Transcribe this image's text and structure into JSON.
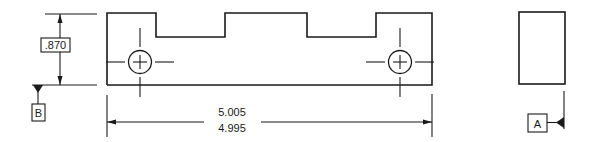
{
  "drawing": {
    "front_view": {
      "height_dimension": {
        "value": ".870"
      },
      "length_dimension": {
        "upper_limit": "5.005",
        "lower_limit": "4.995"
      },
      "holes": [
        {
          "name": "left-hole"
        },
        {
          "name": "right-hole"
        }
      ]
    },
    "datums": {
      "b": {
        "label": "B"
      },
      "a": {
        "label": "A"
      }
    },
    "colors": {
      "line": "#1a1a1a",
      "background": "#ffffff"
    }
  }
}
